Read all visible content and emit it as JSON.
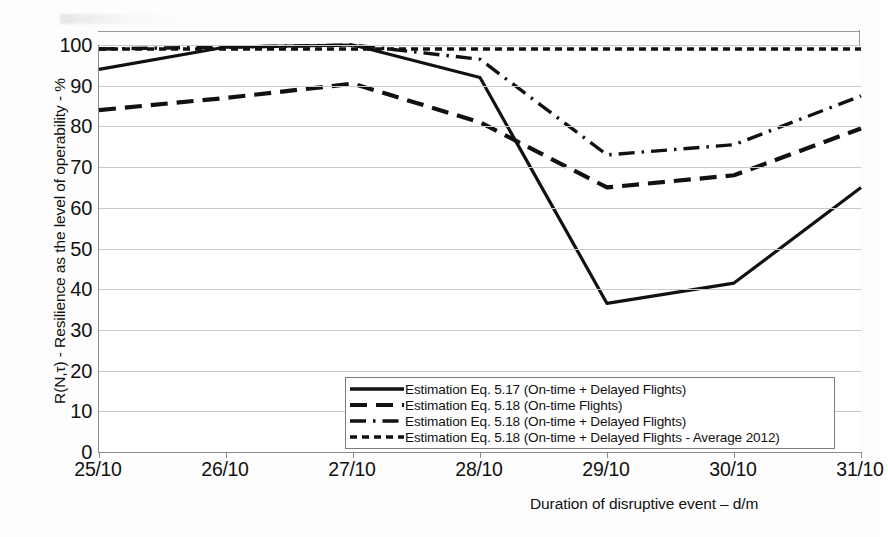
{
  "chart_data": {
    "type": "line",
    "title": "",
    "xlabel": "Duration of disruptive event – d/m",
    "ylabel": "R(N,τ) - Resilience as the level of operability  - %",
    "categories": [
      "25/10",
      "26/10",
      "27/10",
      "28/10",
      "29/10",
      "30/10",
      "31/10"
    ],
    "ylim": [
      0,
      100
    ],
    "ytick_labels": [
      "0",
      "10",
      "20",
      "30",
      "40",
      "50",
      "60",
      "70",
      "80",
      "90",
      "100"
    ],
    "yticks": [
      0,
      10,
      20,
      30,
      40,
      50,
      60,
      70,
      80,
      90,
      100
    ],
    "grid": true,
    "legend_position": "inside-bottom-center",
    "series": [
      {
        "name": "Estimation Eq. 5.17 (On-time + Delayed Flights)",
        "style": "solid",
        "values": [
          94,
          99.5,
          100,
          92,
          36.5,
          41.5,
          65
        ]
      },
      {
        "name": "Estimation Eq. 5.18  (On-time Flights)",
        "style": "dashed",
        "values": [
          84,
          87,
          90.5,
          81,
          65,
          68,
          79.5
        ]
      },
      {
        "name": "Estimation Eq. 5.18 (On-time + Delayed Flights)",
        "style": "dash-dot",
        "values": [
          99,
          99.5,
          100,
          96.5,
          73,
          75.5,
          87.5
        ]
      },
      {
        "name": "Estimation Eq. 5.18 (On-time + Delayed Flights - Average 2012)",
        "style": "dotted",
        "values": [
          99,
          99,
          99,
          99,
          99,
          99,
          99
        ]
      }
    ],
    "colors": {
      "series_line": "#111111",
      "gridline": "#c9c9c9",
      "axis": "#8a8a8a",
      "background": "#ffffff",
      "text": "#111111"
    }
  }
}
